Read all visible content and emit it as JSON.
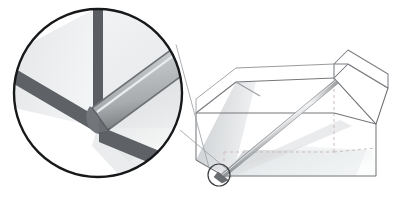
{
  "figure": {
    "title": "Rod resting in an open box with magnified corner detail",
    "type": "geometric-illustration",
    "canvas": {
      "width": 399,
      "height": 197,
      "background": "#ffffff"
    },
    "colors": {
      "background": "#ffffff",
      "box_edge": "#6f7276",
      "box_edge_light": "#9fa2a6",
      "hidden_edge": "#c9b9b9",
      "face_fill": "#ffffff",
      "face_fill_shaded": "#cfd2d4",
      "floor_shadow": "#e3e6e8",
      "rod_body": "#b9bcbe",
      "rod_highlight": "#e8eaeb",
      "rod_dark": "#8d9093",
      "detail_circle_stroke": "#16181a",
      "detail_circle_fill": "#ffffff",
      "detail_edge_dark": "#53565a",
      "detail_face_a": "#eceeee",
      "detail_face_b": "#e2e4e5",
      "detail_face_c": "#f7f8f8",
      "callout_line": "#9fa2a6",
      "marker_circle_stroke": "#3b3d40"
    },
    "elements": [
      {
        "name": "open-box",
        "label": "Open rectangular box",
        "description": "Rectangular cardboard box shown in oblique projection with two upright flaps open at the right end"
      },
      {
        "name": "box-flap-open",
        "label": "Open flap",
        "description": "Parallelogram flap folded outward at the right end of the box"
      },
      {
        "name": "rod",
        "label": "Rod",
        "description": "Straight cylindrical rod lying diagonally from the top right rim down to the near bottom left corner of the box interior"
      },
      {
        "name": "hidden-edges",
        "label": "Hidden edges",
        "description": "Dashed lines marking the box edges concealed behind the visible faces"
      },
      {
        "name": "floor-shadow",
        "label": "Cast shadow",
        "description": "Soft grey shadow cast by the box and the rod onto the floor plane"
      },
      {
        "name": "detail-marker",
        "label": "Detail marker",
        "description": "Small circle ringing the rod tip at the bottom left corner of the box"
      },
      {
        "name": "callout-lines",
        "label": "Callout lines",
        "description": "Two tangent lines joining the small detail marker to the large magnifier circle"
      },
      {
        "name": "magnifier-circle",
        "label": "Magnified corner detail",
        "description": "Large circle at the left enlarging the corner where the rounded end of the rod meets the two converging box edges"
      }
    ],
    "magnifier": {
      "center_x": 98,
      "center_y": 93,
      "radius": 85,
      "stroke_width": 2.4
    },
    "detail_marker": {
      "center_x": 219,
      "center_y": 175,
      "radius": 11,
      "stroke_width": 1.2
    }
  }
}
